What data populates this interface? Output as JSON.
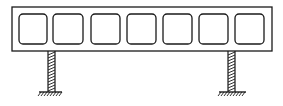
{
  "diagram": {
    "type": "structural-drawing",
    "stroke_color": "#1a1a1a",
    "background": "#ffffff",
    "beam": {
      "x": 12,
      "y": 7,
      "width": 260,
      "height": 44,
      "cells": [
        {
          "x": 19,
          "y": 14,
          "w": 28,
          "h": 30
        },
        {
          "x": 53,
          "y": 14,
          "w": 30,
          "h": 30
        },
        {
          "x": 91,
          "y": 14,
          "w": 29,
          "h": 30
        },
        {
          "x": 127,
          "y": 14,
          "w": 29,
          "h": 30
        },
        {
          "x": 163,
          "y": 14,
          "w": 29,
          "h": 30
        },
        {
          "x": 199,
          "y": 14,
          "w": 29,
          "h": 30
        },
        {
          "x": 235,
          "y": 14,
          "w": 29,
          "h": 30
        }
      ]
    },
    "supports": [
      {
        "name": "left-column",
        "x": 48,
        "width": 7,
        "top": 51,
        "bottom": 92,
        "ground_x1": 39,
        "ground_x2": 62
      },
      {
        "name": "right-column",
        "x": 228,
        "width": 7,
        "top": 51,
        "bottom": 92,
        "ground_x1": 219,
        "ground_x2": 246
      }
    ]
  }
}
